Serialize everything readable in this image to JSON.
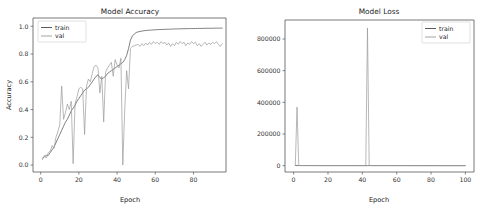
{
  "figure": {
    "background_color": "#ffffff",
    "panel_count": 2
  },
  "chart_data": [
    {
      "type": "line",
      "id": "model-accuracy",
      "title": "Model Accuracy",
      "xlabel": "Epoch",
      "ylabel": "Accuracy",
      "xlim": [
        -4,
        97
      ],
      "ylim": [
        -0.05,
        1.06
      ],
      "xticks": [
        0,
        20,
        40,
        60,
        80
      ],
      "xtick_labels": [
        "0",
        "20",
        "40",
        "60",
        "80"
      ],
      "yticks": [
        0.0,
        0.2,
        0.4,
        0.6,
        0.8,
        1.0
      ],
      "ytick_labels": [
        "0.0",
        "0.2",
        "0.4",
        "0.6",
        "0.8",
        "1.0"
      ],
      "grid": false,
      "legend": {
        "position": "upper-left",
        "entries": [
          {
            "name": "train",
            "color": "#4a4a4a"
          },
          {
            "name": "val",
            "color": "#9a9a9a"
          }
        ]
      },
      "x": [
        1,
        2,
        3,
        4,
        5,
        6,
        7,
        8,
        9,
        10,
        11,
        12,
        13,
        14,
        15,
        16,
        17,
        18,
        19,
        20,
        21,
        22,
        23,
        24,
        25,
        26,
        27,
        28,
        29,
        30,
        31,
        32,
        33,
        34,
        35,
        36,
        37,
        38,
        39,
        40,
        41,
        42,
        43,
        44,
        45,
        46,
        47,
        48,
        49,
        50,
        51,
        52,
        53,
        54,
        55,
        56,
        57,
        58,
        59,
        60,
        61,
        62,
        63,
        64,
        65,
        66,
        67,
        68,
        69,
        70,
        71,
        72,
        73,
        74,
        75,
        76,
        77,
        78,
        79,
        80,
        81,
        82,
        83,
        84,
        85,
        86,
        87,
        88,
        89,
        90,
        91,
        92,
        93,
        94,
        95
      ],
      "series": [
        {
          "name": "train",
          "color": "#4a4a4a",
          "values": [
            0.05,
            0.06,
            0.07,
            0.07,
            0.09,
            0.11,
            0.13,
            0.16,
            0.19,
            0.22,
            0.25,
            0.28,
            0.31,
            0.33,
            0.36,
            0.39,
            0.41,
            0.43,
            0.46,
            0.48,
            0.5,
            0.52,
            0.54,
            0.55,
            0.56,
            0.58,
            0.6,
            0.62,
            0.64,
            0.65,
            0.63,
            0.62,
            0.63,
            0.64,
            0.66,
            0.67,
            0.68,
            0.69,
            0.7,
            0.71,
            0.72,
            0.73,
            0.74,
            0.76,
            0.79,
            0.84,
            0.9,
            0.93,
            0.945,
            0.955,
            0.96,
            0.963,
            0.966,
            0.968,
            0.97,
            0.971,
            0.972,
            0.973,
            0.974,
            0.975,
            0.976,
            0.977,
            0.977,
            0.978,
            0.978,
            0.979,
            0.979,
            0.98,
            0.98,
            0.981,
            0.981,
            0.982,
            0.982,
            0.982,
            0.983,
            0.983,
            0.983,
            0.984,
            0.984,
            0.984,
            0.984,
            0.985,
            0.985,
            0.985,
            0.985,
            0.986,
            0.986,
            0.986,
            0.986,
            0.986,
            0.987,
            0.987,
            0.987,
            0.987,
            0.987
          ]
        },
        {
          "name": "val",
          "color": "#9a9a9a",
          "values": [
            0.04,
            0.07,
            0.05,
            0.09,
            0.1,
            0.14,
            0.12,
            0.2,
            0.24,
            0.29,
            0.57,
            0.33,
            0.38,
            0.44,
            0.4,
            0.46,
            0.01,
            0.44,
            0.49,
            0.55,
            0.56,
            0.55,
            0.22,
            0.57,
            0.62,
            0.6,
            0.66,
            0.71,
            0.72,
            0.7,
            0.52,
            0.64,
            0.31,
            0.67,
            0.7,
            0.72,
            0.74,
            0.64,
            0.76,
            0.72,
            0.7,
            0.77,
            0.0,
            0.4,
            0.68,
            0.55,
            0.84,
            0.855,
            0.86,
            0.865,
            0.87,
            0.855,
            0.875,
            0.86,
            0.88,
            0.865,
            0.885,
            0.87,
            0.89,
            0.875,
            0.885,
            0.87,
            0.89,
            0.875,
            0.885,
            0.865,
            0.88,
            0.855,
            0.875,
            0.86,
            0.885,
            0.87,
            0.89,
            0.875,
            0.885,
            0.86,
            0.88,
            0.87,
            0.89,
            0.875,
            0.885,
            0.86,
            0.875,
            0.855,
            0.87,
            0.885,
            0.865,
            0.88,
            0.87,
            0.885,
            0.875,
            0.89,
            0.87,
            0.855,
            0.875
          ]
        }
      ]
    },
    {
      "type": "line",
      "id": "model-loss",
      "title": "Model Loss",
      "xlabel": "Epoch",
      "ylabel": "",
      "xlim": [
        -5,
        105
      ],
      "ylim": [
        -40000,
        920000
      ],
      "xticks": [
        0,
        20,
        40,
        60,
        80,
        100
      ],
      "xtick_labels": [
        "0",
        "20",
        "40",
        "60",
        "80",
        "100"
      ],
      "yticks": [
        0,
        200000,
        400000,
        600000,
        800000
      ],
      "ytick_labels": [
        "0",
        "200000",
        "400000",
        "600000",
        "800000"
      ],
      "grid": false,
      "legend": {
        "position": "upper-right",
        "entries": [
          {
            "name": "train",
            "color": "#4a4a4a"
          },
          {
            "name": "val",
            "color": "#9a9a9a"
          }
        ]
      },
      "x": [
        1,
        2,
        3,
        4,
        5,
        6,
        7,
        8,
        9,
        10,
        11,
        12,
        13,
        14,
        15,
        16,
        17,
        18,
        19,
        20,
        21,
        22,
        23,
        24,
        25,
        26,
        27,
        28,
        29,
        30,
        31,
        32,
        33,
        34,
        35,
        36,
        37,
        38,
        39,
        40,
        41,
        42,
        43,
        44,
        45,
        46,
        47,
        48,
        49,
        50,
        51,
        52,
        53,
        54,
        55,
        56,
        57,
        58,
        59,
        60,
        61,
        62,
        63,
        64,
        65,
        66,
        67,
        68,
        69,
        70,
        71,
        72,
        73,
        74,
        75,
        76,
        77,
        78,
        79,
        80,
        81,
        82,
        83,
        84,
        85,
        86,
        87,
        88,
        89,
        90,
        91,
        92,
        93,
        94,
        95,
        96,
        97,
        98,
        99,
        100
      ],
      "series": [
        {
          "name": "train",
          "color": "#4a4a4a",
          "values": [
            900,
            800,
            700,
            650,
            600,
            560,
            520,
            500,
            480,
            460,
            440,
            430,
            420,
            410,
            400,
            395,
            390,
            385,
            380,
            375,
            370,
            365,
            360,
            355,
            350,
            345,
            340,
            335,
            330,
            325,
            320,
            315,
            310,
            305,
            300,
            295,
            290,
            285,
            280,
            275,
            270,
            265,
            260,
            255,
            250,
            245,
            240,
            235,
            230,
            225,
            220,
            215,
            210,
            205,
            200,
            195,
            190,
            185,
            180,
            175,
            170,
            165,
            160,
            155,
            150,
            145,
            140,
            135,
            130,
            125,
            120,
            115,
            110,
            105,
            100,
            98,
            95,
            92,
            90,
            88,
            85,
            82,
            80,
            78,
            75,
            72,
            70,
            68,
            65,
            62,
            60,
            58,
            55,
            52,
            50,
            48,
            45,
            42,
            40,
            38
          ]
        },
        {
          "name": "val",
          "color": "#9a9a9a",
          "values": [
            2000,
            370000,
            1200,
            900,
            800,
            760,
            720,
            700,
            680,
            660,
            640,
            620,
            600,
            590,
            580,
            570,
            560,
            550,
            540,
            530,
            520,
            510,
            500,
            490,
            480,
            470,
            460,
            450,
            440,
            430,
            420,
            410,
            400,
            390,
            380,
            370,
            360,
            350,
            340,
            330,
            320,
            310,
            870000,
            2500,
            900,
            850,
            800,
            780,
            760,
            740,
            720,
            700,
            680,
            660,
            640,
            620,
            600,
            580,
            560,
            540,
            520,
            500,
            480,
            460,
            440,
            420,
            400,
            380,
            360,
            340,
            320,
            300,
            290,
            280,
            270,
            260,
            250,
            240,
            230,
            220,
            210,
            200,
            190,
            180,
            170,
            160,
            150,
            140,
            130,
            120,
            110,
            100,
            95,
            90,
            85,
            80,
            75,
            70,
            65
          ]
        }
      ]
    }
  ]
}
